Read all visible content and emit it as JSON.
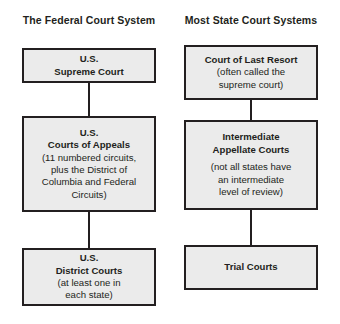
{
  "diagram": {
    "colors": {
      "box_fill": "#ebebeb",
      "box_border": "#231f20",
      "text": "#231f20",
      "background": "#ffffff"
    },
    "columns": [
      {
        "id": "federal",
        "heading": "The Federal Court System",
        "nodes": [
          {
            "id": "us-supreme-court",
            "title": "U.S.\nSupreme Court",
            "note": ""
          },
          {
            "id": "us-courts-of-appeals",
            "title": "U.S.\nCourts of Appeals",
            "note": "(11 numbered circuits,\nplus the District of\nColumbia and Federal\nCircuits)"
          },
          {
            "id": "us-district-courts",
            "title": "U.S.\nDistrict Courts",
            "note": "(at least one in\neach state)"
          }
        ]
      },
      {
        "id": "state",
        "heading": "Most State Court Systems",
        "nodes": [
          {
            "id": "court-of-last-resort",
            "title": "Court of Last Resort",
            "note": "(often called the\nsupreme court)"
          },
          {
            "id": "intermediate-appellate-courts",
            "title": "Intermediate\nAppellate Courts",
            "note": "(not all states have\nan intermediate\nlevel of review)"
          },
          {
            "id": "trial-courts",
            "title": "Trial Courts",
            "note": ""
          }
        ]
      }
    ]
  }
}
